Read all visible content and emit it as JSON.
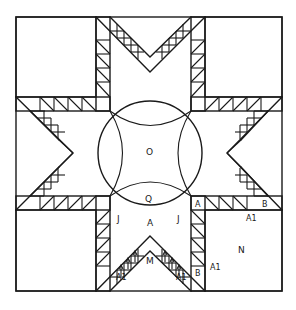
{
  "diagram": {
    "colors": {
      "line": "#1a1a1a",
      "background": "#ffffff"
    },
    "labels": {
      "center": "O",
      "center_lower": "Q",
      "side_left": "J",
      "side_right": "J",
      "bottom_point": "M",
      "corner_bottom_right": "N",
      "strip_right_A": "A",
      "strip_right_B": "B",
      "strip_right_A1": "A1",
      "strip_vertical_A": "A",
      "strip_vertical_B": "B",
      "strip_vertical_A1": "A1",
      "apex_A": "A",
      "bottom_left_A1": "A1",
      "bottom_right_A1": "A1"
    }
  }
}
